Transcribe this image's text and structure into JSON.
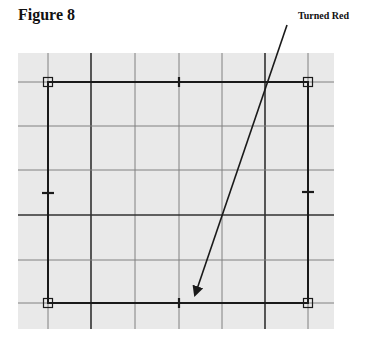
{
  "figure": {
    "title": "Figure 8",
    "annotation": "Turned Red"
  },
  "grid": {
    "background": "#e9e9e9",
    "bounds": {
      "x": 18,
      "y": 53,
      "width": 316,
      "height": 276
    },
    "vertical_lines": [
      48,
      91,
      135,
      179,
      222,
      265,
      308
    ],
    "horizontal_lines": [
      82,
      126,
      170,
      215,
      260,
      303
    ],
    "dark_vertical_lines": [
      91,
      265
    ],
    "dark_horizontal_lines": [
      215
    ],
    "line_color": "#808080",
    "dark_line_color": "#303030"
  },
  "rectangle": {
    "x1": 48,
    "y1": 82,
    "x2": 308,
    "y2": 303,
    "stroke": "#1a1a1a",
    "corner_handles": [
      [
        48,
        82
      ],
      [
        308,
        82
      ],
      [
        48,
        303
      ],
      [
        308,
        303
      ]
    ],
    "midpoint_ticks": [
      {
        "x": 179,
        "y": 82,
        "orient": "v"
      },
      {
        "x": 179,
        "y": 303,
        "orient": "v"
      },
      {
        "x": 48,
        "y": 193,
        "orient": "h"
      },
      {
        "x": 308,
        "y": 192,
        "orient": "h"
      }
    ]
  },
  "arrow": {
    "x1": 287,
    "y1": 25,
    "x2": 195,
    "y2": 295,
    "color": "#1a1a1a"
  }
}
